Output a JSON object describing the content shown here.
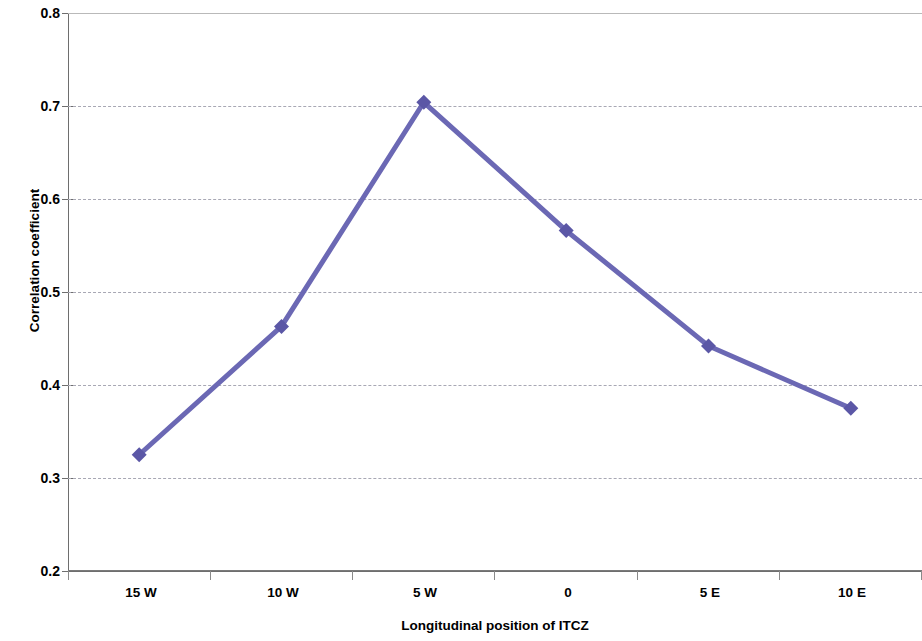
{
  "chart_data": {
    "type": "line",
    "title": "",
    "xlabel": "Longitudinal position of ITCZ",
    "ylabel": "Correlation coefficient",
    "categories": [
      "15 W",
      "10 W",
      "5 W",
      "0",
      "5 E",
      "10 E"
    ],
    "values": [
      0.325,
      0.463,
      0.704,
      0.566,
      0.442,
      0.375
    ],
    "series": [
      {
        "name": "Correlation coefficient",
        "values": [
          0.325,
          0.463,
          0.704,
          0.566,
          0.442,
          0.375
        ]
      }
    ],
    "ylim": [
      0.2,
      0.8
    ],
    "ytick_step": 0.1,
    "yticks": [
      "0.2",
      "0.3",
      "0.4",
      "0.5",
      "0.6",
      "0.7",
      "0.8"
    ],
    "ytick_values": [
      0.2,
      0.3,
      0.4,
      0.5,
      0.6,
      0.7,
      0.8
    ],
    "grid": true,
    "grid_axis": "y",
    "grid_style": "dashed",
    "legend": false,
    "legend_position": "none",
    "marker": "diamond",
    "colors": {
      "series_line": "#6B68B4",
      "marker": "#5B57A6",
      "gridline": "#A8A8B4",
      "axis": "#6E6E6E",
      "text": "#000000",
      "background": "#FFFFFF"
    }
  }
}
